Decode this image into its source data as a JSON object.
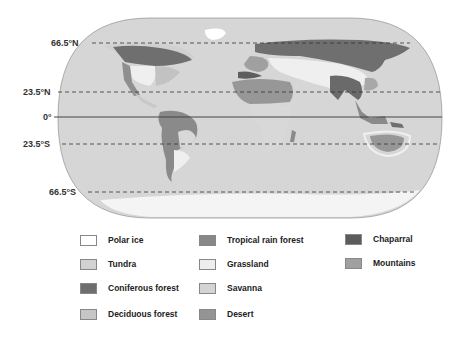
{
  "map": {
    "type": "world-biomes-map",
    "latitude_lines": [
      {
        "label": "66.5°N",
        "y": 43,
        "style": "dashed"
      },
      {
        "label": "23.5°N",
        "y": 92,
        "style": "dashed"
      },
      {
        "label": "0°",
        "y": 117,
        "style": "solid"
      },
      {
        "label": "23.5°S",
        "y": 144,
        "style": "dashed"
      },
      {
        "label": "66.5°S",
        "y": 192,
        "style": "dashed"
      }
    ],
    "colors": {
      "ocean": "#d6d6d6",
      "polar_ice": "#ffffff",
      "tundra": "#d0d0d0",
      "coniferous": "#6f6f6f",
      "deciduous": "#c2c2c2",
      "tropical": "#8a8a8a",
      "grassland": "#efefef",
      "savanna": "#d8d8d8",
      "desert": "#979797",
      "chaparral": "#5e5e5e",
      "mountains": "#a3a3a3"
    }
  },
  "legend": {
    "items": [
      {
        "label": "Polar ice",
        "color": "#ffffff"
      },
      {
        "label": "Tundra",
        "color": "#d2d2d2"
      },
      {
        "label": "Coniferous forest",
        "color": "#6e6e6e"
      },
      {
        "label": "Deciduous forest",
        "color": "#c6c6c6"
      },
      {
        "label": "Tropical rain forest",
        "color": "#888888"
      },
      {
        "label": "Grassland",
        "color": "#eeeeee"
      },
      {
        "label": "Savanna",
        "color": "#d4d4d4"
      },
      {
        "label": "Desert",
        "color": "#949494"
      },
      {
        "label": "Chaparral",
        "color": "#5c5c5c"
      },
      {
        "label": "Mountains",
        "color": "#a0a0a0"
      }
    ]
  }
}
